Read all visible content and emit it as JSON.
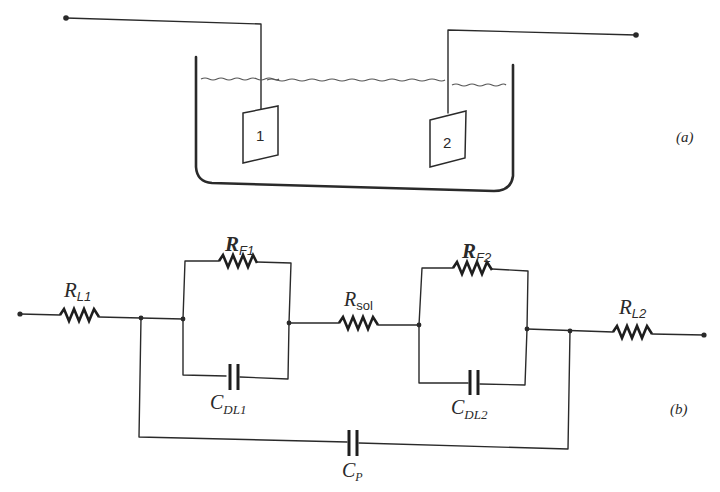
{
  "figure": {
    "part_a": {
      "label": "(a)",
      "electrodes": [
        {
          "id": "1",
          "label": "1"
        },
        {
          "id": "2",
          "label": "2"
        }
      ]
    },
    "part_b": {
      "label": "(b)",
      "components": {
        "RL1": {
          "main": "R",
          "sub": "L1"
        },
        "RF1": {
          "main": "R",
          "sub": "F1"
        },
        "CDL1": {
          "main": "C",
          "sub": "DL1"
        },
        "Rsol": {
          "main": "R",
          "sub": "sol"
        },
        "RF2": {
          "main": "R",
          "sub": "F2"
        },
        "CDL2": {
          "main": "C",
          "sub": "DL2"
        },
        "RL2": {
          "main": "R",
          "sub": "L2"
        },
        "CP": {
          "main": "C",
          "sub": "P"
        }
      }
    }
  }
}
